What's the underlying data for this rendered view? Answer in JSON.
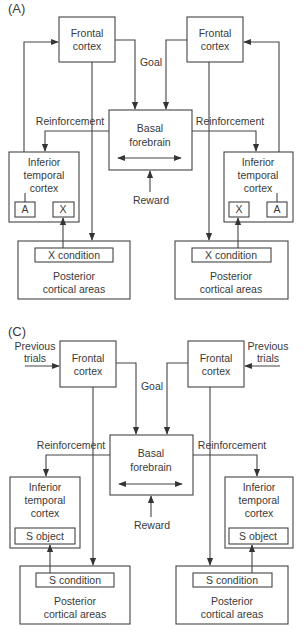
{
  "panels": [
    {
      "label": "(A)",
      "frontal_left": [
        "Frontal",
        "cortex"
      ],
      "frontal_right": [
        "Frontal",
        "cortex"
      ],
      "goal": "Goal",
      "basal": [
        "Basal",
        "forebrain"
      ],
      "reward": "Reward",
      "reinforcement_left": "Reinforcement",
      "reinforcement_right": "Reinforcement",
      "it_left": [
        "Inferior",
        "temporal",
        "cortex"
      ],
      "it_right": [
        "Inferior",
        "temporal",
        "cortex"
      ],
      "it_left_items": [
        "A",
        "X"
      ],
      "it_right_items": [
        "X",
        "A"
      ],
      "condition_left": "X condition",
      "condition_right": "X condition",
      "posterior_left": [
        "Posterior",
        "cortical areas"
      ],
      "posterior_right": [
        "Posterior",
        "cortical areas"
      ]
    },
    {
      "label": "(C)",
      "previous_left": [
        "Previous",
        "trials"
      ],
      "previous_right": [
        "Previous",
        "trials"
      ],
      "frontal_left": [
        "Frontal",
        "cortex"
      ],
      "frontal_right": [
        "Frontal",
        "cortex"
      ],
      "goal": "Goal",
      "basal": [
        "Basal",
        "forebrain"
      ],
      "reward": "Reward",
      "reinforcement_left": "Reinforcement",
      "reinforcement_right": "Reinforcement",
      "it_left": [
        "Inferior",
        "temporal",
        "cortex"
      ],
      "it_right": [
        "Inferior",
        "temporal",
        "cortex"
      ],
      "object_left": "S object",
      "object_right": "S object",
      "condition_left": "S condition",
      "condition_right": "S condition",
      "posterior_left": [
        "Posterior",
        "cortical areas"
      ],
      "posterior_right": [
        "Posterior",
        "cortical areas"
      ]
    }
  ],
  "colors": {
    "line": "#444444",
    "text": "#3a3a3a",
    "background": "#ffffff"
  }
}
